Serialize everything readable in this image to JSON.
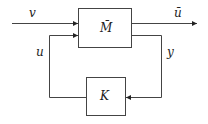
{
  "diagram": {
    "plant_label": "M̄",
    "controller_label": "K",
    "input_label": "v",
    "output_label": "ū",
    "control_label": "u",
    "measurement_label": "y",
    "line_color": "#444444"
  }
}
